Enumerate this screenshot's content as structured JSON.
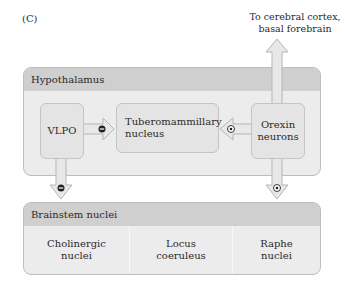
{
  "panel_label": "(C)",
  "output_target": {
    "line1": "To cerebral cortex,",
    "line2": "basal forebrain"
  },
  "hypothalamus": {
    "title": "Hypothalamus",
    "nodes": {
      "vlpo": "VLPO",
      "tmn_line1": "Tuberomammillary",
      "tmn_line2": "nucleus",
      "orexin_line1": "Orexin",
      "orexin_line2": "neurons"
    }
  },
  "brainstem": {
    "title": "Brainstem nuclei",
    "cells": [
      {
        "line1": "Cholinergic",
        "line2": "nuclei"
      },
      {
        "line1": "Locus",
        "line2": "coeruleus"
      },
      {
        "line1": "Raphe",
        "line2": "nuclei"
      }
    ]
  },
  "connections": [
    {
      "from": "VLPO",
      "to": "Tuberomammillary nucleus",
      "sign": "inhibitory"
    },
    {
      "from": "Orexin neurons",
      "to": "Tuberomammillary nucleus",
      "sign": "excitatory"
    },
    {
      "from": "VLPO",
      "to": "Brainstem nuclei",
      "sign": "inhibitory"
    },
    {
      "from": "Orexin neurons",
      "to": "Brainstem nuclei",
      "sign": "excitatory"
    },
    {
      "from": "Orexin neurons",
      "to": "Cerebral cortex, basal forebrain",
      "sign": "none"
    }
  ],
  "colors": {
    "group_fill": "#ececec",
    "header_fill": "#cfcfcf",
    "node_fill": "#e4e4e4",
    "arrow_fill": "#e6e6e6",
    "inhibitory_badge": "#222222",
    "excitatory_badge": "#ffffff"
  }
}
